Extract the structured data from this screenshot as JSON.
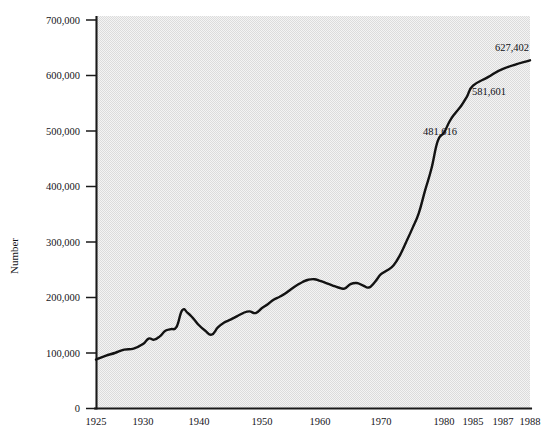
{
  "chart_data": {
    "type": "line",
    "title": "",
    "subtitle": "",
    "xlabel": "",
    "ylabel": "Number",
    "xlim": [
      1925,
      1988
    ],
    "ylim": [
      0,
      700000
    ],
    "grid": false,
    "legend": null,
    "y_ticks": [
      "0",
      "100,000",
      "200,000",
      "300,000",
      "400,000",
      "500,000",
      "600,000",
      "700,000"
    ],
    "y_tick_values": [
      0,
      100000,
      200000,
      300000,
      400000,
      500000,
      600000,
      700000
    ],
    "x_ticks": [
      "1925",
      "1930",
      "1940",
      "1950",
      "1960",
      "1970",
      "1980",
      "1985",
      "1987",
      "1988"
    ],
    "x_tick_values": [
      1925,
      1930,
      1940,
      1950,
      1960,
      1970,
      1980,
      1985,
      1987,
      1988
    ],
    "x_tick_px": [
      96,
      143,
      199,
      262,
      320,
      381,
      444,
      473,
      503,
      530
    ],
    "annotations": [
      {
        "label": "481,616",
        "x": 1978,
        "y": 481616,
        "px": 433,
        "py": 142,
        "tx": 440,
        "ty": 135
      },
      {
        "label": "581,601",
        "x": 1985,
        "y": 581601,
        "px": 473,
        "py": 86,
        "tx": 489,
        "ty": 95
      },
      {
        "label": "627,402",
        "x": 1988,
        "y": 627402,
        "px": 529,
        "py": 60,
        "tx": 512,
        "ty": 51
      }
    ],
    "series": [
      {
        "name": "Number",
        "x": [
          1925,
          1926,
          1927,
          1928,
          1929,
          1930,
          1931,
          1932,
          1933,
          1934,
          1935,
          1936,
          1937,
          1938,
          1939,
          1940,
          1941,
          1942,
          1943,
          1944,
          1945,
          1946,
          1947,
          1948,
          1949,
          1950,
          1951,
          1952,
          1953,
          1954,
          1955,
          1956,
          1957,
          1958,
          1959,
          1960,
          1961,
          1962,
          1963,
          1964,
          1965,
          1966,
          1967,
          1968,
          1969,
          1970,
          1971,
          1972,
          1973,
          1974,
          1975,
          1976,
          1977,
          1978,
          1979,
          1980,
          1981,
          1982,
          1983,
          1984,
          1985,
          1986,
          1987,
          1988
        ],
        "values": [
          88000,
          95000,
          100000,
          106000,
          108000,
          116000,
          126000,
          124000,
          130000,
          140000,
          143000,
          147000,
          177000,
          172000,
          162000,
          150000,
          140000,
          133000,
          146000,
          155000,
          160000,
          166000,
          172000,
          175000,
          172000,
          181000,
          188000,
          196000,
          201000,
          207000,
          215000,
          222000,
          228000,
          232000,
          233000,
          230000,
          226000,
          222000,
          218000,
          216000,
          224000,
          226000,
          222000,
          218000,
          228000,
          242000,
          249000,
          258000,
          276000,
          300000,
          325000,
          352000,
          393000,
          432000,
          481616,
          497000,
          518000,
          533000,
          546000,
          563000,
          581601,
          597000,
          612000,
          627402
        ]
      }
    ]
  },
  "figure": {
    "plot_bg_color": "#e2e2e2",
    "line_color": "#121212",
    "axis_color": "#1a1a1a",
    "page_bg_color": "#ffffff"
  }
}
